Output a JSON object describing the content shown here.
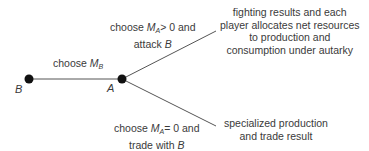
{
  "diagram": {
    "type": "game-tree",
    "nodes": [
      {
        "id": "B",
        "label": "B",
        "x": 29,
        "y": 79
      },
      {
        "id": "A",
        "label": "A",
        "x": 122,
        "y": 79
      }
    ],
    "edges": [
      {
        "from": "B",
        "to": "A",
        "label_pre": "choose ",
        "label_var": "M",
        "label_sub": "B"
      },
      {
        "from": "A",
        "to": "outcome1",
        "label_line1_pre": "choose ",
        "label_line1_var": "M",
        "label_line1_sub": "A",
        "label_line1_post": "> 0 and",
        "label_line2_pre": "attack ",
        "label_line2_var": "B"
      },
      {
        "from": "A",
        "to": "outcome2",
        "label_line1_pre": "choose ",
        "label_line1_var": "M",
        "label_line1_sub": "A",
        "label_line1_post": "= 0 and",
        "label_line2_pre": "trade with ",
        "label_line2_var": "B"
      }
    ],
    "outcomes": {
      "fight": [
        "fighting results and each",
        "player allocates net resources",
        "to production and",
        "consumption under autarky"
      ],
      "trade": [
        "specialized production",
        "and trade result"
      ]
    }
  }
}
